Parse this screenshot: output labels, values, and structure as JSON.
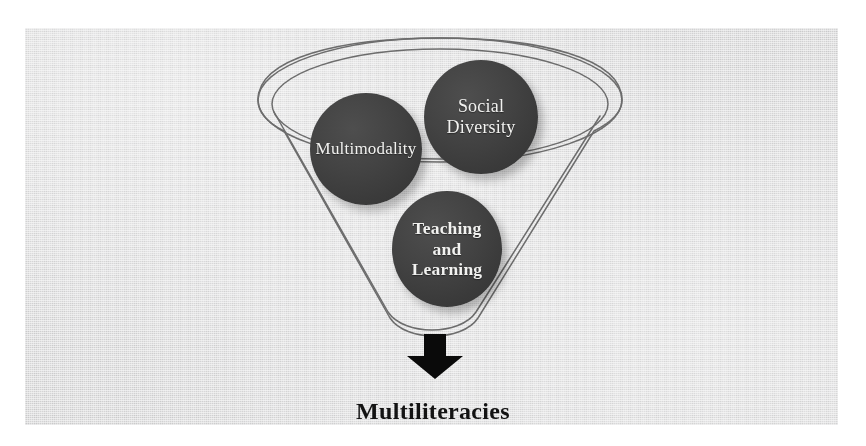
{
  "figure": {
    "type": "funnel-diagram",
    "background_color": "#ededee",
    "node_color": "#3f3f3f",
    "node_text_color": "#f2f2f0",
    "outline_color": "#6e6e6e",
    "arrow_color": "#0a0a0a"
  },
  "container": {
    "name": "funnel",
    "shape": "funnel",
    "rim_style": "double-ellipse"
  },
  "nodes": [
    {
      "id": "multimodality",
      "label": "Multimodality",
      "lines": [
        "Multimodality"
      ],
      "weight": "normal"
    },
    {
      "id": "social-diversity",
      "label": "Social Diversity",
      "lines": [
        "Social",
        "Diversity"
      ],
      "weight": "normal"
    },
    {
      "id": "teaching-and-learning",
      "label": "Teaching and Learning",
      "lines": [
        "Teaching",
        "and",
        "Learning"
      ],
      "weight": "bold"
    }
  ],
  "arrow": {
    "name": "down-arrow",
    "direction": "down"
  },
  "outcome": {
    "label": "Multiliteracies"
  }
}
